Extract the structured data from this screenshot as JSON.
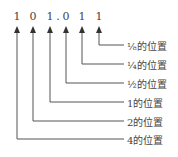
{
  "digits": [
    "1",
    "0",
    "1",
    ".",
    "0",
    "1",
    "1"
  ],
  "labels": {
    "eighth": "⅛的位置",
    "quarter": "¼的位置",
    "half": "½的位置",
    "one": "1的位置",
    "two": "2的位置",
    "four": "4的位置"
  }
}
